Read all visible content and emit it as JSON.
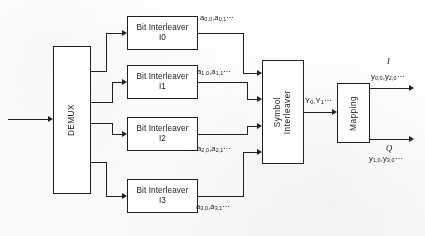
{
  "figure": {
    "ink_color": "#232323",
    "paper_color": "#fdfdfc"
  },
  "blocks": {
    "demux": {
      "label": "DEMUX"
    },
    "interleavers": [
      {
        "name": "bit-interleaver-i0",
        "line1": "Bit Interleaver",
        "line2": "I0"
      },
      {
        "name": "bit-interleaver-i1",
        "line1": "Bit Interleaver",
        "line2": "I1"
      },
      {
        "name": "bit-interleaver-i2",
        "line1": "Bit Interleaver",
        "line2": "I2"
      },
      {
        "name": "bit-interleaver-i3",
        "line1": "Bit Interleaver",
        "line2": "I3"
      }
    ],
    "symbol_interleaver": {
      "line1": "Symbol",
      "line2": "Interleaver"
    },
    "mapping": {
      "label": "Mapping"
    }
  },
  "signals": {
    "interleaver_outputs": [
      {
        "base1": "a",
        "sub1": "0,0",
        "base2": "a",
        "sub2": "0,1",
        "tail": "⋯"
      },
      {
        "base1": "a",
        "sub1": "1,0",
        "base2": "a",
        "sub2": "1,1",
        "tail": "⋯"
      },
      {
        "base1": "a",
        "sub1": "2,0",
        "base2": "a",
        "sub2": "2,1",
        "tail": "⋯"
      },
      {
        "base1": "a",
        "sub1": "3,0",
        "base2": "a",
        "sub2": "3,1",
        "tail": "⋯"
      }
    ],
    "symbol_output": {
      "base1": "Y",
      "sub1": "0",
      "base2": "Y",
      "sub2": "1",
      "tail": "⋯"
    },
    "mapping_i_output": {
      "base1": "y",
      "sub1": "0,0",
      "base2": "y",
      "sub2": "2,0",
      "tail": "⋯"
    },
    "mapping_q_output": {
      "base1": "y",
      "sub1": "1,0",
      "base2": "y",
      "sub2": "3,0",
      "tail": "⋯"
    },
    "branch_i_label": "I",
    "branch_q_label": "Q"
  }
}
